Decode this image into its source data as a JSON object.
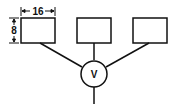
{
  "diagram": {
    "boxes": [
      {
        "id": "box-1",
        "x": 21,
        "y": 18,
        "w": 34,
        "h": 25
      },
      {
        "id": "box-2",
        "x": 77,
        "y": 18,
        "w": 34,
        "h": 25
      },
      {
        "id": "box-3",
        "x": 133,
        "y": 18,
        "w": 34,
        "h": 25
      }
    ],
    "width_dimension_label": "16",
    "height_dimension_label": "8",
    "valve_label": "V",
    "stroke_color": "#111111",
    "background_color": "#ffffff"
  }
}
